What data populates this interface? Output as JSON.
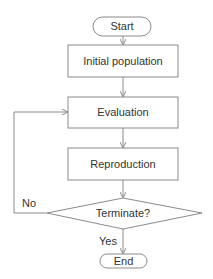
{
  "diagram": {
    "type": "flowchart",
    "nodes": {
      "start": {
        "label": "Start",
        "shape": "terminal"
      },
      "init": {
        "label": "Initial population",
        "shape": "process"
      },
      "eval": {
        "label": "Evaluation",
        "shape": "process"
      },
      "repro": {
        "label": "Reproduction",
        "shape": "process"
      },
      "term": {
        "label": "Terminate?",
        "shape": "decision"
      },
      "end": {
        "label": "End",
        "shape": "terminal"
      }
    },
    "edges": {
      "no": {
        "label": "No"
      },
      "yes": {
        "label": "Yes"
      }
    },
    "colors": {
      "stroke": "#8a8a8a",
      "text": "#333333",
      "background": "#ffffff"
    }
  }
}
